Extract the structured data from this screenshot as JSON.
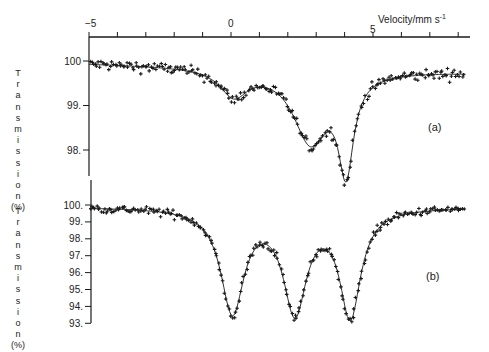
{
  "chart_data": [
    {
      "type": "scatter",
      "panel_label": "(a)",
      "title": "",
      "xlabel": "Velocity/mm s⁻¹",
      "ylabel": "Transmission (%)",
      "xlim": [
        -5,
        8.3
      ],
      "ylim": [
        97.4,
        100.5
      ],
      "x_ticks": [
        -5,
        -4,
        -3,
        -2,
        -1,
        0,
        1,
        2,
        3,
        4,
        5,
        6,
        7,
        8
      ],
      "x_tick_labels": [
        "-5",
        "0",
        "5"
      ],
      "y_ticks": [
        100,
        99,
        98
      ],
      "y_tick_labels": [
        "100",
        "99.",
        "98."
      ],
      "grid": false,
      "baseline": 99.95,
      "slope": -0.05,
      "fit_components": [
        {
          "center": 0.1,
          "depth": 0.6,
          "width": 1.2
        },
        {
          "center": 2.8,
          "depth": 1.6,
          "width": 1.5
        },
        {
          "center": 4.05,
          "depth": 2.1,
          "width": 0.65
        }
      ],
      "series": [
        {
          "name": "measured",
          "marker": "+",
          "description": "experimental points scattered around the fit"
        },
        {
          "name": "fit",
          "marker": "line"
        }
      ],
      "notable_points": [
        {
          "x": -5,
          "y": 100.0
        },
        {
          "x": 0.0,
          "y": 99.25
        },
        {
          "x": 1.1,
          "y": 99.6
        },
        {
          "x": 2.9,
          "y": 98.1
        },
        {
          "x": 3.4,
          "y": 98.2
        },
        {
          "x": 4.05,
          "y": 97.5
        },
        {
          "x": 5.0,
          "y": 99.4
        },
        {
          "x": 8.0,
          "y": 99.85
        }
      ]
    },
    {
      "type": "scatter",
      "panel_label": "(b)",
      "title": "",
      "xlabel": "Velocity/mm s⁻¹",
      "ylabel": "Transmission (%)",
      "xlim": [
        -5,
        8.3
      ],
      "ylim": [
        93,
        100.5
      ],
      "x_ticks": [
        -5,
        -4,
        -3,
        -2,
        -1,
        0,
        1,
        2,
        3,
        4,
        5,
        6,
        7,
        8
      ],
      "x_tick_labels": [
        "-5",
        "0",
        "5"
      ],
      "y_ticks": [
        100,
        99,
        98,
        97,
        96,
        95,
        94,
        93
      ],
      "y_tick_labels": [
        "100.",
        "99.",
        "98.",
        "97.",
        "96.",
        "95.",
        "94.",
        "93."
      ],
      "grid": false,
      "baseline": 99.9,
      "slope": 0.0,
      "fit_components": [
        {
          "center": 0.05,
          "depth": 6.1,
          "width": 1.0
        },
        {
          "center": 2.25,
          "depth": 6.0,
          "width": 1.0
        },
        {
          "center": 4.2,
          "depth": 6.3,
          "width": 0.9
        }
      ],
      "series": [
        {
          "name": "measured",
          "marker": "+",
          "description": "experimental points scattered around the fit"
        },
        {
          "name": "fit",
          "marker": "line"
        }
      ],
      "notable_points": [
        {
          "x": -5,
          "y": 99.8
        },
        {
          "x": -0.1,
          "y": 93.8
        },
        {
          "x": 1.2,
          "y": 97.7
        },
        {
          "x": 2.3,
          "y": 93.8
        },
        {
          "x": 3.2,
          "y": 97.3
        },
        {
          "x": 4.2,
          "y": 93.4
        },
        {
          "x": 5.2,
          "y": 99.2
        },
        {
          "x": 8.0,
          "y": 100.0
        }
      ]
    }
  ],
  "axis": {
    "velocity_label": "Velocity/mm s",
    "velocity_superscript": "-1",
    "top_tick_labels": [
      "−5",
      "0",
      "5"
    ]
  },
  "panels": {
    "a": {
      "label": "(a)",
      "y_tick_labels": [
        "100",
        "99.",
        "98."
      ]
    },
    "b": {
      "label": "(b)",
      "y_tick_labels": [
        "100.",
        "99.",
        "98.",
        "97.",
        "96.",
        "95.",
        "94.",
        "93."
      ]
    }
  },
  "y_axis_title_letters": [
    "T",
    "r",
    "a",
    "n",
    "s",
    "m",
    "i",
    "s",
    "s",
    "i",
    "o",
    "n",
    "(%)"
  ],
  "colors": {
    "ink": "#1a1a1a",
    "background": "#ffffff"
  }
}
